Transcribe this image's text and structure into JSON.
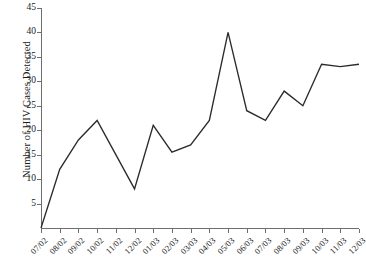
{
  "chart_data": {
    "type": "line",
    "title": "",
    "xlabel": "",
    "ylabel": "Number of HIV Cases Detected",
    "categories": [
      "07/02",
      "08/02",
      "09/02",
      "10/02",
      "11/02",
      "12/02",
      "01/03",
      "02/03",
      "03/03",
      "04/03",
      "05/03",
      "06/03",
      "07/03",
      "08/03",
      "09/03",
      "10/03",
      "11/03",
      "12/03"
    ],
    "values": [
      0,
      12,
      18,
      22,
      15,
      8,
      21,
      15.5,
      17,
      22,
      40,
      24,
      22,
      28,
      25,
      33.5,
      33,
      33.5
    ],
    "series": [
      {
        "name": "HIV Cases Detected",
        "values": [
          0,
          12,
          18,
          22,
          15,
          8,
          21,
          15.5,
          17,
          22,
          40,
          24,
          22,
          28,
          25,
          33.5,
          33,
          33.5
        ]
      }
    ],
    "ylim": [
      0,
      45
    ],
    "y_ticks": [
      5,
      10,
      15,
      20,
      25,
      30,
      35,
      40,
      45
    ],
    "y_tick_labels": [
      "5",
      "10",
      "15",
      "20",
      "25",
      "30",
      "35",
      "40",
      "45"
    ],
    "grid": false,
    "legend": false,
    "legend_position": "none",
    "line_color": "#2b2b2b",
    "axis_color": "#6d6d6d",
    "background_color": "#ffffff",
    "x_tick_rotation": -45
  }
}
